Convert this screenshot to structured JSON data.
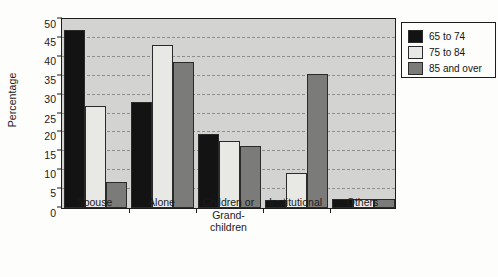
{
  "chart_data": {
    "type": "bar",
    "title": "",
    "xlabel": "",
    "ylabel": "Percentage",
    "ylim": [
      0,
      50
    ],
    "ytick_step": 5,
    "yticks": [
      "0",
      "5",
      "10",
      "15",
      "20",
      "25",
      "30",
      "35",
      "40",
      "45",
      "50"
    ],
    "grid": true,
    "legend_position": "right-top",
    "categories": [
      "Spouse",
      "Alone",
      "Children or Grand-children",
      "Institutional",
      "Others"
    ],
    "category_lines": [
      [
        "Spouse"
      ],
      [
        "Alone"
      ],
      [
        "Children or",
        "Grand-",
        "children"
      ],
      [
        "Institutional"
      ],
      [
        "Others"
      ]
    ],
    "series": [
      {
        "name": "65 to 74",
        "color": "#131313",
        "values": [
          47.0,
          28.0,
          19.5,
          2.0,
          2.5
        ]
      },
      {
        "name": "75 to 84",
        "color": "#e8e8e4",
        "values": [
          27.0,
          43.0,
          17.8,
          9.2,
          2.5
        ]
      },
      {
        "name": "85 and over",
        "color": "#7b7b79",
        "values": [
          7.0,
          38.5,
          16.5,
          35.4,
          2.4
        ]
      }
    ]
  },
  "legend": {
    "items": [
      {
        "label": "65 to 74",
        "swatch": "#131313"
      },
      {
        "label": "75 to 84",
        "swatch": "#e8e8e4"
      },
      {
        "label": "85 and over",
        "swatch": "#7b7b79"
      }
    ]
  },
  "colors": {
    "plot_background": "#d3d3d1",
    "page_background": "#fdfdfb",
    "axis": "#1d1d1d",
    "gridline": "#8e8e8c"
  }
}
